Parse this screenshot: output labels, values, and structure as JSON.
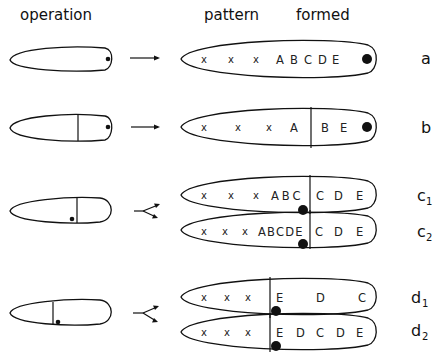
{
  "headers": {
    "operation": "operation",
    "pattern": "pattern",
    "formed": "formed"
  },
  "rows": [
    {
      "label": "a",
      "operation": "excision of posterior tip",
      "result_rows": [
        {
          "tokens": [
            "x",
            "x",
            "x",
            "A",
            "B",
            "C",
            "D",
            "E"
          ],
          "sub": ""
        }
      ]
    },
    {
      "label": "b",
      "operation": "transplant posterior tip to midline",
      "result_rows": [
        {
          "left": [
            "x",
            "x",
            "x",
            "A"
          ],
          "right": [
            "B",
            "E"
          ]
        }
      ]
    },
    {
      "label_base": "c",
      "sub_labels": [
        "1",
        "2"
      ],
      "result_rows": [
        {
          "left": [
            "x",
            "x",
            "x",
            "A",
            "B",
            "C"
          ],
          "right": [
            "C",
            "D",
            "E"
          ]
        },
        {
          "left": [
            "x",
            "x",
            "x",
            "A",
            "B",
            "C",
            "D",
            "E"
          ],
          "right": [
            "C",
            "D",
            "E"
          ]
        }
      ]
    },
    {
      "label_base": "d",
      "sub_labels": [
        "1",
        "2"
      ],
      "result_rows": [
        {
          "left": [
            "x",
            "x",
            "x"
          ],
          "right": [
            "E",
            "D",
            "C"
          ]
        },
        {
          "left": [
            "x",
            "x",
            "x"
          ],
          "right": [
            "E",
            "D",
            "C",
            "D",
            "E"
          ]
        }
      ]
    }
  ],
  "labels": {
    "a": "a",
    "b": "b",
    "c": "c",
    "c1": "1",
    "c2": "2",
    "d": "d",
    "d1": "1",
    "d2": "2"
  },
  "tokens": {
    "a": [
      "x",
      "x",
      "x",
      "A",
      "B",
      "C",
      "D",
      "E"
    ],
    "b_left": [
      "x",
      "x",
      "x",
      "A"
    ],
    "b_right": [
      "B",
      "E"
    ],
    "c1_left": [
      "x",
      "x",
      "x",
      "ABC"
    ],
    "c1_right": [
      "C",
      "D",
      "E"
    ],
    "c2_left": [
      "x",
      "x",
      "x",
      "ABCDE"
    ],
    "c2_right": [
      "C",
      "D",
      "E"
    ],
    "d1_left": [
      "x",
      "x",
      "x"
    ],
    "d1_right": [
      "E",
      "D",
      "C"
    ],
    "d2_left": [
      "x",
      "x",
      "x"
    ],
    "d2_right": [
      "E",
      "D",
      "C",
      "D",
      "E"
    ]
  },
  "arrows": {
    "a": "single-arrow",
    "b": "single-arrow",
    "c": "forked-arrow",
    "d": "forked-arrow"
  },
  "colors": {
    "ink": "#111111",
    "background": "#ffffff"
  }
}
